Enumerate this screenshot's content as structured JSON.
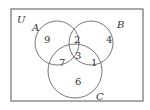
{
  "diagram": {
    "type": "venn",
    "universe_label": "U",
    "sets": [
      {
        "name": "A",
        "label": "A"
      },
      {
        "name": "B",
        "label": "B"
      },
      {
        "name": "C",
        "label": "C"
      }
    ],
    "regions": {
      "A_only": "9",
      "B_only": "4",
      "C_only": "6",
      "A_and_B_only": "2",
      "A_and_C_only": "7",
      "B_and_C_only": "1",
      "A_and_B_and_C": "3"
    },
    "colors": {
      "stroke": "#555555",
      "text": "#333333",
      "background": "#ffffff"
    }
  }
}
